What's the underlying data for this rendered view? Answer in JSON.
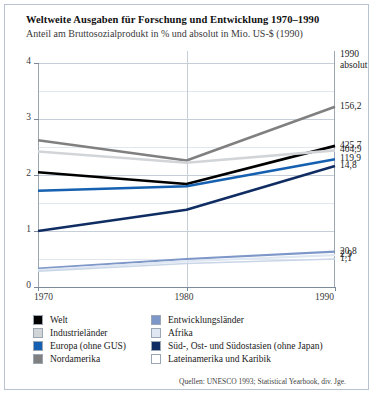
{
  "header": {
    "title": "Weltweite Ausgaben für Forschung und Entwicklung 1970–1990",
    "subtitle": "Anteil am Bruttosozialprodukt in % und absolut in Mio. US-$ (1990)"
  },
  "right_header": {
    "line1": "1990",
    "line2": "absolut"
  },
  "source": "Quellen: UNESCO 1993; Statistical Yearbook, div. Jge.",
  "legend": {
    "items": [
      {
        "label": "Welt",
        "color": "#000000"
      },
      {
        "label": "Entwicklungsländer",
        "color": "#7d97c8"
      },
      {
        "label": "Industrieländer",
        "color": "#d2d5d8"
      },
      {
        "label": "Afrika",
        "color": "#dfe7f2"
      },
      {
        "label": "Europa (ohne GUS)",
        "color": "#1560b0"
      },
      {
        "label": "Süd-, Ost- und Südostasien (ohne Japan)",
        "color": "#102d63"
      },
      {
        "label": "Nordamerika",
        "color": "#808080"
      },
      {
        "label": "Lateinamerika und Karibik",
        "color": "#ffffff"
      }
    ]
  },
  "chart_data": {
    "type": "line",
    "title": "Weltweite Ausgaben für Forschung und Entwicklung 1970–1990",
    "subtitle": "Anteil am Bruttosozialprodukt in % und absolut in Mio. US-$ (1990)",
    "xlabel": "",
    "ylabel": "",
    "x": [
      1970,
      1980,
      1990
    ],
    "xticklabels": [
      "1970",
      "1980",
      "1990"
    ],
    "ylim": [
      0,
      4
    ],
    "yticks": [
      0,
      1,
      2,
      3,
      4
    ],
    "yticklabels": [
      "0",
      "1",
      "2",
      "3",
      "4"
    ],
    "minor_gridlines": [
      0.5,
      1.5,
      2.5,
      3.5
    ],
    "grid": true,
    "legend_position": "below-plot",
    "value_label_header": "1990 absolut",
    "series": [
      {
        "name": "Nordamerika",
        "color": "#808080",
        "width": 2.6,
        "values": [
          2.62,
          2.26,
          3.22
        ],
        "label_1990": "156,2"
      },
      {
        "name": "Welt",
        "color": "#000000",
        "width": 2.6,
        "values": [
          2.05,
          1.84,
          2.52
        ],
        "label_1990": "425,7"
      },
      {
        "name": "Industrieländer",
        "color": "#d2d5d8",
        "width": 2.6,
        "values": [
          2.42,
          2.22,
          2.44
        ],
        "label_1990": "404,9"
      },
      {
        "name": "Europa (ohne GUS)",
        "color": "#1560b0",
        "width": 2.6,
        "values": [
          1.72,
          1.8,
          2.28
        ],
        "label_1990": "119,9"
      },
      {
        "name": "Süd-, Ost- und Südostasien (ohne Japan)",
        "color": "#102d63",
        "width": 2.6,
        "values": [
          1.0,
          1.38,
          2.16
        ],
        "label_1990": "14,8"
      },
      {
        "name": "Entwicklungsländer",
        "color": "#7d97c8",
        "width": 2.2,
        "values": [
          0.33,
          0.5,
          0.63
        ],
        "label_1990": "20,8"
      },
      {
        "name": "Afrika",
        "color": "#dfe7f2",
        "width": 2.2,
        "values": [
          0.3,
          0.46,
          0.57
        ],
        "label_1990": "2,9"
      },
      {
        "name": "Lateinamerika und Karibik",
        "color": "#c9d6e8",
        "width": 1.6,
        "values": [
          0.28,
          0.42,
          0.5
        ],
        "label_1990": "1,1"
      }
    ]
  }
}
